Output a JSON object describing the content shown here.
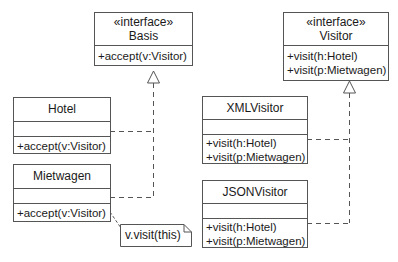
{
  "diagram": {
    "type": "UML class diagram",
    "pattern": "Visitor"
  },
  "classes": {
    "basis": {
      "stereotype": "«interface»",
      "name": "Basis",
      "attributes": [],
      "methods": [
        "+accept(v:Visitor)"
      ]
    },
    "visitor": {
      "stereotype": "«interface»",
      "name": "Visitor",
      "attributes": [],
      "methods": [
        "+visit(h:Hotel)",
        "+visit(p:Mietwagen)"
      ]
    },
    "hotel": {
      "name": "Hotel",
      "attributes": [],
      "methods": [
        "+accept(v:Visitor)"
      ]
    },
    "mietwagen": {
      "name": "Mietwagen",
      "attributes": [],
      "methods": [
        "+accept(v:Visitor)"
      ]
    },
    "xmlvisitor": {
      "name": "XMLVisitor",
      "attributes": [],
      "methods": [
        "+visit(h:Hotel)",
        "+visit(p:Mietwagen)"
      ]
    },
    "jsonvisitor": {
      "name": "JSONVisitor",
      "attributes": [],
      "methods": [
        "+visit(h:Hotel)",
        "+visit(p:Mietwagen)"
      ]
    }
  },
  "note": {
    "text": "v.visit(this)",
    "attached_to": "mietwagen.accept"
  },
  "relations": [
    {
      "from": "Hotel",
      "to": "Basis",
      "type": "realization"
    },
    {
      "from": "Mietwagen",
      "to": "Basis",
      "type": "realization"
    },
    {
      "from": "XMLVisitor",
      "to": "Visitor",
      "type": "realization"
    },
    {
      "from": "JSONVisitor",
      "to": "Visitor",
      "type": "realization"
    }
  ],
  "colors": {
    "line": "#555555",
    "text": "#1a1a1a",
    "background": "#ffffff"
  }
}
